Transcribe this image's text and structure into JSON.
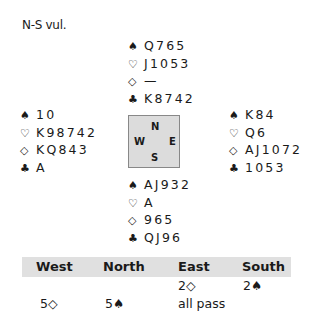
{
  "vulnerability": "N-S vul.",
  "suits": {
    "spades": "♠",
    "hearts": "♡",
    "diamonds": "◇",
    "clubs": "♣"
  },
  "hands": {
    "north": {
      "spades": "Q765",
      "hearts": "J1053",
      "diamonds": "—",
      "clubs": "K8742"
    },
    "west": {
      "spades": "10",
      "hearts": "K98742",
      "diamonds": "KQ843",
      "clubs": "A"
    },
    "east": {
      "spades": "K84",
      "hearts": "Q6",
      "diamonds": "AJ1072",
      "clubs": "1053"
    },
    "south": {
      "spades": "AJ932",
      "hearts": "A",
      "diamonds": "965",
      "clubs": "QJ96"
    }
  },
  "compass": {
    "n": "N",
    "s": "S",
    "w": "W",
    "e": "E"
  },
  "auction": {
    "headers": [
      "West",
      "North",
      "East",
      "South"
    ],
    "rows": [
      [
        "",
        "",
        "2◇",
        "2♠"
      ],
      [
        "5◇",
        "5♠",
        "all pass",
        ""
      ]
    ]
  }
}
